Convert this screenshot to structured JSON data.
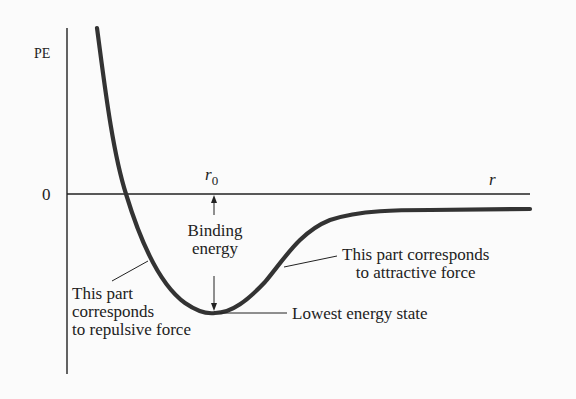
{
  "axes": {
    "y_label": "PE",
    "x_label": "r",
    "zero_label": "0"
  },
  "markers": {
    "r0_label": "r",
    "r0_subscript": "0"
  },
  "annotations": {
    "binding_energy": [
      "Binding",
      "energy"
    ],
    "lowest_state": "Lowest energy state",
    "attractive": [
      "This part corresponds",
      "to attractive force"
    ],
    "repulsive": [
      "This part",
      "corresponds",
      "to repulsive force"
    ]
  },
  "colors": {
    "curve": "#333333",
    "axes": "#222222",
    "background": "#fbfbfb"
  }
}
